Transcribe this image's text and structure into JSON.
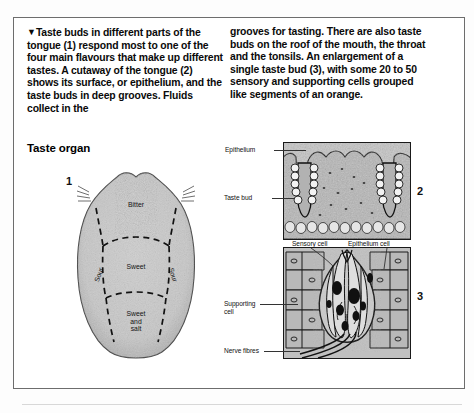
{
  "document": {
    "intro_paragraph_left": "Taste buds in different parts of the tongue (1) respond most to one of the four main flavours that make up different tastes. A cutaway of the tongue (2) shows its surface, or epithelium, and the taste buds in deep grooves. Fluids collect in the",
    "intro_paragraph_right": "grooves for tasting. There are also taste buds on the roof of the mouth, the throat and the tonsils. An enlargement of a single taste bud (3), with some 20 to 50 sensory and supporting cells grouped like segments of an orange.",
    "bullet_marker": "▼",
    "section_heading": "Taste organ"
  },
  "figures": {
    "numbers": {
      "one": "1",
      "two": "2",
      "three": "3"
    }
  },
  "tongue_map": {
    "regions": [
      {
        "name": "bitter",
        "label": "Bitter"
      },
      {
        "name": "sweet",
        "label": "Sweet"
      },
      {
        "name": "sweet-and-salt",
        "label_line1": "Sweet",
        "label_line2": "and",
        "label_line3": "salt"
      },
      {
        "name": "sour-left",
        "label": "Sour"
      },
      {
        "name": "sour-right",
        "label": "Sour"
      }
    ]
  },
  "panel2_labels": {
    "epithelium": "Epithelium",
    "taste_bud": "Taste bud"
  },
  "panel3_labels": {
    "sensory_cell": "Sensory cell",
    "epithelium_cell": "Epithelium cell",
    "supporting_cell_line1": "Supporting",
    "supporting_cell_line2": "cell",
    "nerve_fibres": "Nerve fibres"
  },
  "colors": {
    "page_background": "#fdfdfd",
    "frame_border": "#6d6d6d",
    "tongue_fill": "#c9c9c9",
    "tissue_fill": "#bfbfbf",
    "ink": "#111111"
  }
}
